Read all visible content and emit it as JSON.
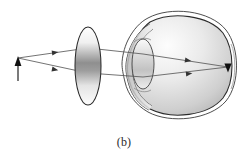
{
  "figure": {
    "caption": "(b)",
    "width": 248,
    "height": 153,
    "background_color": "#ffffff"
  },
  "colors": {
    "outline": "#2b2b2b",
    "ray": "#5a5a5a",
    "ray_arrow": "#3a3a3a",
    "object_arrow": "#1a1a1a",
    "eye_fill_light": "#fbfbfb",
    "eye_fill_mid": "#d8d8d8",
    "eye_fill_dark": "#a8a8a8",
    "lens_fill_light": "#ffffff",
    "lens_fill_mid": "#9a9a9a",
    "cornea_fill": "#cfcfcf"
  },
  "object": {
    "label": "object-arrow",
    "base_x": 18,
    "base_y": 80,
    "tip_x": 18,
    "tip_y": 58,
    "direction": "up"
  },
  "corrective_lens": {
    "label": "converging-lens",
    "center_x": 88,
    "center_y": 66,
    "rx": 13,
    "ry": 39
  },
  "eye": {
    "label": "eyeball",
    "center_x": 190,
    "center_y": 65,
    "rx": 42,
    "ry": 47,
    "cornea": {
      "label": "cornea",
      "apex_x": 126,
      "top_y": 30,
      "bottom_y": 104
    },
    "crystalline_lens": {
      "label": "crystalline-lens",
      "center_x": 143,
      "center_y": 64,
      "rx": 11,
      "ry": 25
    },
    "retina_image": {
      "label": "inverted-image-on-retina",
      "x": 228,
      "y": 67,
      "direction": "down"
    }
  },
  "rays": [
    {
      "name": "upper-ray",
      "points": "18,58 88,48 143,54 228,67",
      "arrowheads": [
        {
          "x": 52,
          "y": 53,
          "angle": -8
        },
        {
          "x": 185,
          "y": 60,
          "angle": 9
        },
        {
          "x": 224,
          "y": 66,
          "angle": 9
        }
      ]
    },
    {
      "name": "lower-ray",
      "points": "18,58 88,73 143,77 228,67",
      "arrowheads": [
        {
          "x": 52,
          "y": 69,
          "angle": 12
        },
        {
          "x": 186,
          "y": 74,
          "angle": -6
        }
      ]
    }
  ],
  "ray_legend": {
    "count": 2,
    "description": "two rays from object tip refract through corrective lens then eye to focus on retina"
  }
}
